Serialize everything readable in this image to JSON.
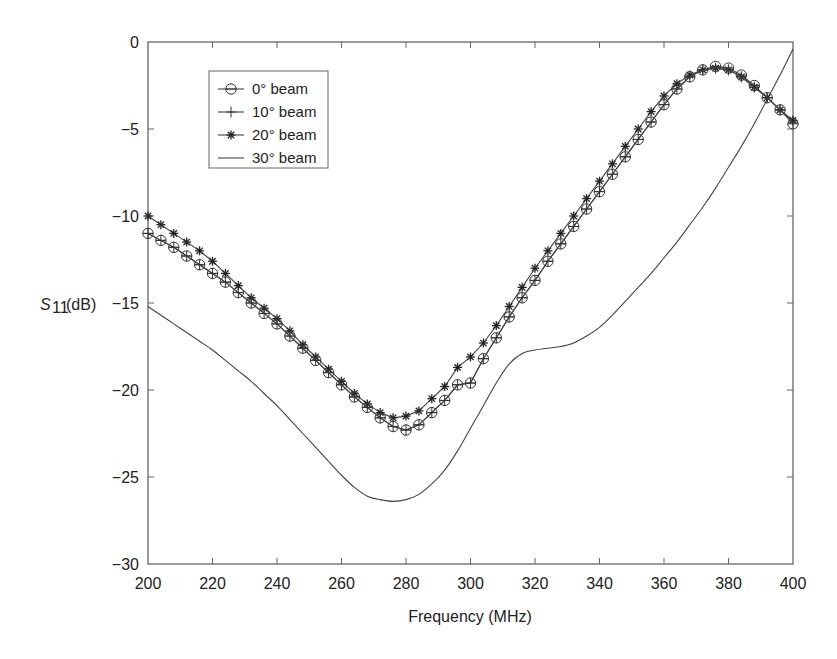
{
  "chart_data": {
    "type": "line",
    "title": "",
    "xlabel": "Frequency (MHz)",
    "ylabel_main": "S",
    "ylabel_sub": "11",
    "ylabel_unit": "(dB)",
    "xlim": [
      200,
      400
    ],
    "ylim": [
      -30,
      0
    ],
    "xticks": [
      200,
      220,
      240,
      260,
      280,
      300,
      320,
      340,
      360,
      380,
      400
    ],
    "yticks": [
      0,
      -5,
      -10,
      -15,
      -20,
      -25,
      -30
    ],
    "xtick_labels": [
      "200",
      "220",
      "240",
      "260",
      "280",
      "300",
      "320",
      "340",
      "360",
      "380",
      "400"
    ],
    "ytick_labels": [
      "0",
      "−5",
      "−10",
      "−15",
      "−20",
      "−25",
      "−30"
    ],
    "grid": false,
    "legend_position": "top-left",
    "x": [
      200,
      204,
      208,
      212,
      216,
      220,
      224,
      228,
      232,
      236,
      240,
      244,
      248,
      252,
      256,
      260,
      264,
      268,
      272,
      276,
      280,
      284,
      288,
      292,
      296,
      300,
      304,
      308,
      312,
      316,
      320,
      324,
      328,
      332,
      336,
      340,
      344,
      348,
      352,
      356,
      360,
      364,
      368,
      372,
      376,
      380,
      384,
      388,
      392,
      396,
      400
    ],
    "series": [
      {
        "name": "0° beam",
        "marker": "circle",
        "values": [
          -11.0,
          -11.4,
          -11.8,
          -12.3,
          -12.8,
          -13.3,
          -13.8,
          -14.4,
          -15.0,
          -15.6,
          -16.2,
          -16.9,
          -17.6,
          -18.3,
          -19.0,
          -19.7,
          -20.4,
          -21.0,
          -21.6,
          -22.1,
          -22.3,
          -22.0,
          -21.3,
          -20.6,
          -19.7,
          -19.6,
          -18.2,
          -17.0,
          -15.8,
          -14.7,
          -13.7,
          -12.6,
          -11.6,
          -10.6,
          -9.6,
          -8.6,
          -7.6,
          -6.6,
          -5.6,
          -4.6,
          -3.6,
          -2.7,
          -2.0,
          -1.6,
          -1.4,
          -1.5,
          -1.9,
          -2.5,
          -3.2,
          -3.9,
          -4.7
        ]
      },
      {
        "name": "10° beam",
        "marker": "plus",
        "values": [
          -11.0,
          -11.4,
          -11.8,
          -12.3,
          -12.8,
          -13.3,
          -13.8,
          -14.4,
          -15.0,
          -15.6,
          -16.2,
          -16.9,
          -17.6,
          -18.3,
          -19.0,
          -19.7,
          -20.4,
          -21.0,
          -21.6,
          -22.1,
          -22.3,
          -22.0,
          -21.3,
          -20.6,
          -19.7,
          -19.6,
          -18.2,
          -17.0,
          -15.8,
          -14.7,
          -13.7,
          -12.6,
          -11.6,
          -10.6,
          -9.6,
          -8.6,
          -7.6,
          -6.6,
          -5.6,
          -4.6,
          -3.6,
          -2.7,
          -2.0,
          -1.6,
          -1.5,
          -1.6,
          -2.0,
          -2.6,
          -3.2,
          -3.9,
          -4.6
        ]
      },
      {
        "name": "20° beam",
        "marker": "asterisk",
        "values": [
          -10.0,
          -10.5,
          -11.0,
          -11.5,
          -12.0,
          -12.6,
          -13.3,
          -14.0,
          -14.7,
          -15.3,
          -15.9,
          -16.6,
          -17.4,
          -18.1,
          -18.8,
          -19.5,
          -20.2,
          -20.8,
          -21.3,
          -21.6,
          -21.5,
          -21.2,
          -20.5,
          -19.8,
          -18.7,
          -18.1,
          -17.3,
          -16.3,
          -15.2,
          -14.1,
          -13.0,
          -12.0,
          -11.0,
          -10.0,
          -9.0,
          -8.0,
          -7.0,
          -6.0,
          -5.0,
          -4.0,
          -3.1,
          -2.4,
          -1.9,
          -1.6,
          -1.5,
          -1.6,
          -2.0,
          -2.6,
          -3.2,
          -3.9,
          -4.5
        ]
      },
      {
        "name": "30° beam",
        "marker": "none",
        "values": [
          -15.2,
          -15.7,
          -16.2,
          -16.7,
          -17.2,
          -17.7,
          -18.3,
          -18.9,
          -19.5,
          -20.2,
          -20.9,
          -21.7,
          -22.5,
          -23.3,
          -24.1,
          -24.9,
          -25.6,
          -26.1,
          -26.3,
          -26.4,
          -26.3,
          -26.0,
          -25.4,
          -24.6,
          -23.5,
          -22.2,
          -20.9,
          -19.6,
          -18.5,
          -17.9,
          -17.7,
          -17.6,
          -17.5,
          -17.3,
          -16.9,
          -16.4,
          -15.7,
          -14.9,
          -14.1,
          -13.3,
          -12.4,
          -11.5,
          -10.5,
          -9.5,
          -8.4,
          -7.2,
          -6.0,
          -4.7,
          -3.3,
          -1.9,
          -0.4
        ]
      }
    ]
  }
}
